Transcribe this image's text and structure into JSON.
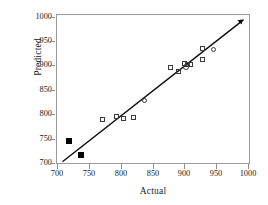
{
  "chart_data": {
    "type": "scatter",
    "title": "",
    "xlabel": "Actual",
    "ylabel": "Predicted",
    "xlim": [
      690,
      1010
    ],
    "ylim": [
      690,
      1010
    ],
    "xticks": [
      700,
      750,
      800,
      850,
      900,
      950,
      1000
    ],
    "yticks": [
      700,
      750,
      800,
      850,
      900,
      950,
      1000
    ],
    "xtick_labels": [
      "700",
      "750",
      "800",
      "850",
      "900",
      "950",
      "1000"
    ],
    "ytick_labels": [
      "700",
      "750",
      "800",
      "850",
      "900",
      "950",
      "1000"
    ],
    "grid": false,
    "legend": "none",
    "series": [
      {
        "name": "open-squares",
        "marker": "square-open",
        "points": [
          {
            "x": 766,
            "y": 787
          },
          {
            "x": 789,
            "y": 792
          },
          {
            "x": 800,
            "y": 789
          },
          {
            "x": 817,
            "y": 790
          },
          {
            "x": 878,
            "y": 897
          },
          {
            "x": 890,
            "y": 890
          },
          {
            "x": 901,
            "y": 905
          },
          {
            "x": 906,
            "y": 904
          },
          {
            "x": 911,
            "y": 904
          },
          {
            "x": 930,
            "y": 937
          },
          {
            "x": 931,
            "y": 915
          }
        ]
      },
      {
        "name": "open-circles",
        "marker": "circle-open",
        "points": [
          {
            "x": 834,
            "y": 828
          },
          {
            "x": 903,
            "y": 899
          },
          {
            "x": 948,
            "y": 936
          }
        ]
      },
      {
        "name": "filled-squares",
        "marker": "square-filled",
        "points": [
          {
            "x": 710,
            "y": 742
          },
          {
            "x": 729,
            "y": 712
          }
        ]
      },
      {
        "name": "filled-triangle",
        "marker": "triangle-filled",
        "points": [
          {
            "x": 995,
            "y": 997
          }
        ]
      }
    ],
    "fit_line": {
      "name": "regression-line",
      "x_start": 700,
      "y_start": 698,
      "x_end": 997,
      "y_end": 999
    }
  },
  "axes": {
    "y_title": "Predicted",
    "x_title": "Actual"
  }
}
